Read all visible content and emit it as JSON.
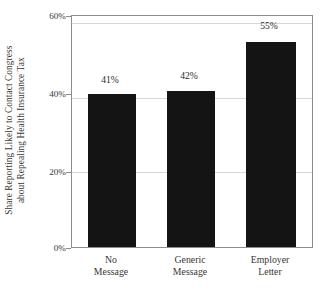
{
  "chart_data": {
    "type": "bar",
    "title": "",
    "subtitle": "",
    "xlabel": "",
    "ylabel": "Share Reporting Likely to Contact Congress about Repealing Health Insurance Tax",
    "ylabel_lines": [
      "Share Reporting Likely to Contact Congress",
      "about Repealing Health Insurance Tax"
    ],
    "categories": [
      "No Message",
      "Generic Message",
      "Employer Letter"
    ],
    "category_lines": [
      [
        "No",
        "Message"
      ],
      [
        "Generic",
        "Message"
      ],
      [
        "Employer",
        "Letter"
      ]
    ],
    "values": [
      41,
      42,
      55
    ],
    "value_labels": [
      "41%",
      "42%",
      "55%"
    ],
    "ylim": [
      0,
      62
    ],
    "yticks": [
      0,
      20,
      40,
      60
    ],
    "ytick_labels": [
      "0%",
      "20%",
      "40%",
      "60%"
    ],
    "grid": true,
    "grid_axis": "y",
    "legend": null,
    "bar_color": "#141414",
    "grid_color": "#d6d6d6",
    "frame_color": "#8d8d8d",
    "text_color": "#3a3632"
  },
  "axes": {
    "ytick_0": "0%",
    "ytick_20": "20%",
    "ytick_40": "40%",
    "ytick_60": "60%"
  },
  "bars": [
    {
      "label": "41%",
      "cat_line1": "No",
      "cat_line2": "Message",
      "value": 41
    },
    {
      "label": "42%",
      "cat_line1": "Generic",
      "cat_line2": "Message",
      "value": 42
    },
    {
      "label": "55%",
      "cat_line1": "Employer",
      "cat_line2": "Letter",
      "value": 55
    }
  ]
}
